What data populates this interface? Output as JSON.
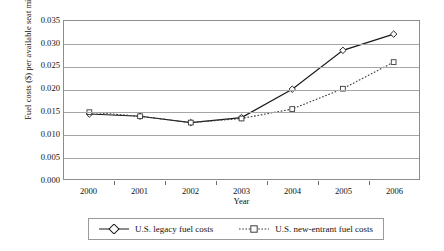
{
  "chart_data": {
    "type": "line",
    "title": "",
    "xlabel": "Year",
    "ylabel": "Fuel costs ($) per available seat mile",
    "categories": [
      "2000",
      "2001",
      "2002",
      "2003",
      "2004",
      "2005",
      "2006"
    ],
    "x": [
      2000,
      2001,
      2002,
      2003,
      2004,
      2005,
      2006
    ],
    "xlim": [
      1999.5,
      2006.5
    ],
    "ylim": [
      0.0,
      0.035
    ],
    "yticks": [
      "0.000",
      "0.005",
      "0.010",
      "0.015",
      "0.020",
      "0.025",
      "0.030",
      "0.035"
    ],
    "ytick_values": [
      0.0,
      0.005,
      0.01,
      0.015,
      0.02,
      0.025,
      0.03,
      0.035
    ],
    "grid": "horizontal",
    "legend_position": "bottom",
    "series": [
      {
        "name": "U.S. legacy fuel costs",
        "style": "solid",
        "marker": "diamond",
        "color": "#1a1a1a",
        "values": [
          0.0144,
          0.0139,
          0.0125,
          0.0136,
          0.0199,
          0.0285,
          0.0321
        ]
      },
      {
        "name": "U.S. new-entrant fuel costs",
        "style": "dotted",
        "marker": "square",
        "color": "#3a3a3a",
        "values": [
          0.0148,
          0.0139,
          0.0125,
          0.0134,
          0.0155,
          0.02,
          0.0259
        ]
      }
    ]
  },
  "legend": {
    "entries": [
      {
        "label": "U.S. legacy fuel costs"
      },
      {
        "label": "U.S. new-entrant fuel costs"
      }
    ]
  }
}
